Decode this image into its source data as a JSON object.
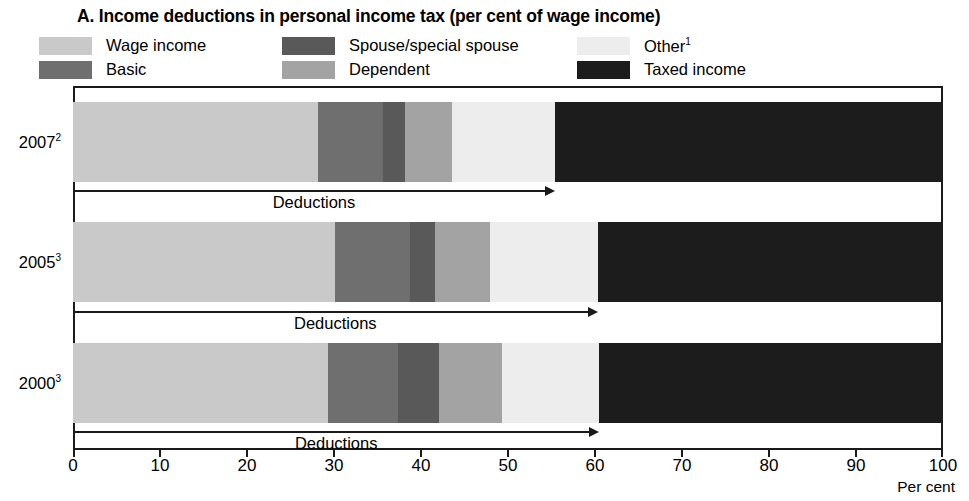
{
  "title": "A. Income deductions in personal income tax (per cent of wage income)",
  "legend": {
    "items": [
      {
        "label": "Wage income",
        "color": "#c9c9c9",
        "col": 1,
        "row": 1,
        "key": "wage_income"
      },
      {
        "label": "Basic",
        "color": "#6f6f6f",
        "col": 1,
        "row": 2,
        "key": "basic"
      },
      {
        "label": "Spouse/special spouse",
        "color": "#595959",
        "col": 2,
        "row": 1,
        "key": "spouse"
      },
      {
        "label": "Dependent",
        "color": "#a3a3a3",
        "col": 2,
        "row": 2,
        "key": "dependent"
      },
      {
        "label": "Other",
        "label_sup": "1",
        "color": "#ededed",
        "col": 3,
        "row": 1,
        "key": "other"
      },
      {
        "label": "Taxed income",
        "color": "#1c1c1c",
        "col": 3,
        "row": 2,
        "key": "taxed_income"
      }
    ]
  },
  "axis": {
    "unit_label": "Per cent",
    "ticks": [
      0,
      10,
      20,
      30,
      40,
      50,
      60,
      70,
      80,
      90,
      100
    ],
    "min": 0,
    "max": 100
  },
  "rows": [
    {
      "year_label": "2007",
      "year_sup": "2",
      "deduction_label": "Deductions",
      "deduction_end": 55.4,
      "segments": [
        {
          "key": "wage_income",
          "value": 28.2,
          "color": "#c9c9c9"
        },
        {
          "key": "basic",
          "value": 7.4,
          "color": "#6f6f6f"
        },
        {
          "key": "spouse",
          "value": 2.6,
          "color": "#595959"
        },
        {
          "key": "dependent",
          "value": 5.4,
          "color": "#a3a3a3"
        },
        {
          "key": "other",
          "value": 11.8,
          "color": "#ededed"
        },
        {
          "key": "taxed_income",
          "value": 44.6,
          "color": "#1c1c1c"
        }
      ]
    },
    {
      "year_label": "2005",
      "year_sup": "3",
      "deduction_label": "Deductions",
      "deduction_end": 60.3,
      "segments": [
        {
          "key": "wage_income",
          "value": 30.1,
          "color": "#c9c9c9"
        },
        {
          "key": "basic",
          "value": 8.6,
          "color": "#6f6f6f"
        },
        {
          "key": "spouse",
          "value": 2.9,
          "color": "#595959"
        },
        {
          "key": "dependent",
          "value": 6.3,
          "color": "#a3a3a3"
        },
        {
          "key": "other",
          "value": 12.4,
          "color": "#ededed"
        },
        {
          "key": "taxed_income",
          "value": 39.7,
          "color": "#1c1c1c"
        }
      ]
    },
    {
      "year_label": "2000",
      "year_sup": "3",
      "deduction_label": "Deductions",
      "deduction_end": 60.5,
      "segments": [
        {
          "key": "wage_income",
          "value": 29.3,
          "color": "#c9c9c9"
        },
        {
          "key": "basic",
          "value": 8.0,
          "color": "#6f6f6f"
        },
        {
          "key": "spouse",
          "value": 4.8,
          "color": "#595959"
        },
        {
          "key": "dependent",
          "value": 7.2,
          "color": "#a3a3a3"
        },
        {
          "key": "other",
          "value": 11.2,
          "color": "#ededed"
        },
        {
          "key": "taxed_income",
          "value": 39.5,
          "color": "#1c1c1c"
        }
      ]
    }
  ],
  "chart_data": {
    "type": "bar",
    "orientation": "horizontal",
    "stacked": true,
    "stack_normalized_to": 100,
    "title": "A. Income deductions in personal income tax (per cent of wage income)",
    "xlabel": "Per cent",
    "ylabel": "",
    "xlim": [
      0,
      100
    ],
    "xticks": [
      0,
      10,
      20,
      30,
      40,
      50,
      60,
      70,
      80,
      90,
      100
    ],
    "grid": false,
    "legend_position": "top",
    "categories": [
      "2007",
      "2005",
      "2000"
    ],
    "category_footnotes": [
      "2",
      "3",
      "3"
    ],
    "series": [
      {
        "name": "Wage income",
        "values": [
          28.2,
          30.1,
          29.3
        ]
      },
      {
        "name": "Basic",
        "values": [
          7.4,
          8.6,
          8.0
        ]
      },
      {
        "name": "Spouse/special spouse",
        "values": [
          2.6,
          2.9,
          4.8
        ]
      },
      {
        "name": "Dependent",
        "values": [
          5.4,
          6.3,
          7.2
        ]
      },
      {
        "name": "Other",
        "values": [
          11.8,
          12.4,
          11.2
        ]
      },
      {
        "name": "Taxed income",
        "values": [
          44.6,
          39.7,
          39.5
        ]
      }
    ],
    "cumulative_boundaries": {
      "2007": [
        0,
        28.2,
        35.6,
        38.2,
        43.6,
        55.4,
        100
      ],
      "2005": [
        0,
        30.1,
        38.7,
        41.6,
        47.9,
        60.3,
        100
      ],
      "2000": [
        0,
        29.3,
        37.3,
        42.1,
        49.3,
        60.5,
        100
      ]
    },
    "annotations": [
      {
        "text": "Deductions",
        "category": "2007",
        "span": [
          0,
          55.4
        ]
      },
      {
        "text": "Deductions",
        "category": "2005",
        "span": [
          0,
          60.3
        ]
      },
      {
        "text": "Deductions",
        "category": "2000",
        "span": [
          0,
          60.5
        ]
      }
    ]
  }
}
